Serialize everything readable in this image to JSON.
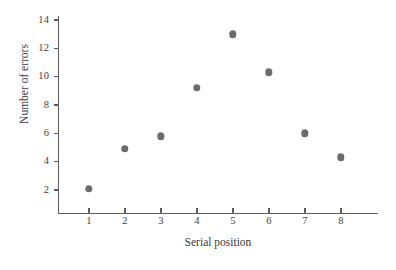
{
  "chart_data": {
    "type": "scatter",
    "title": "",
    "xlabel": "Serial position",
    "ylabel": "Number of errors",
    "x": [
      1,
      2,
      3,
      4,
      5,
      6,
      7,
      8
    ],
    "values": [
      2.1,
      4.9,
      5.8,
      9.2,
      13.0,
      10.3,
      6.0,
      4.3
    ],
    "series": [
      {
        "name": "Number of errors",
        "values": [
          2.1,
          4.9,
          5.8,
          9.2,
          13.0,
          10.3,
          6.0,
          4.3
        ]
      }
    ],
    "categories": [
      "1",
      "2",
      "3",
      "4",
      "5",
      "6",
      "7",
      "8"
    ],
    "xticks": [
      "1",
      "2",
      "3",
      "4",
      "5",
      "6",
      "7",
      "8"
    ],
    "yticks": [
      "2",
      "4",
      "6",
      "8",
      "10",
      "12",
      "14"
    ],
    "xlim": [
      0.35,
      8.9
    ],
    "ylim": [
      0.35,
      14.6
    ],
    "grid": false,
    "legend": false,
    "marker_color": "#6b6b6b",
    "axis_color": "#5d5d5d",
    "background_color": "#ffffff"
  }
}
